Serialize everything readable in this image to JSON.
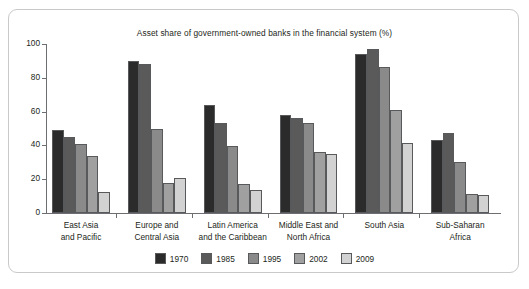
{
  "chart_data": {
    "type": "bar",
    "title": "Asset share of government-owned banks in the financial system (%)",
    "xlabel": "",
    "ylabel": "",
    "ylim": [
      0,
      100
    ],
    "yticks": [
      0,
      20,
      40,
      60,
      80,
      100
    ],
    "grid": false,
    "legend_position": "bottom-center",
    "categories": [
      "East Asia\nand Pacific",
      "Europe and\nCentral Asia",
      "Latin America\nand the Caribbean",
      "Middle East and\nNorth Africa",
      "South Asia",
      "Sub-Saharan\nAfrica"
    ],
    "series": [
      {
        "name": "1970",
        "color": "#2b2b2b",
        "values": [
          49,
          90,
          64,
          58,
          94,
          43.5
        ]
      },
      {
        "name": "1985",
        "color": "#5a5a5a",
        "values": [
          45,
          88,
          53,
          56,
          97,
          47.5
        ]
      },
      {
        "name": "1995",
        "color": "#8a8a8a",
        "values": [
          41,
          49.5,
          39.5,
          53.5,
          86.5,
          30
        ]
      },
      {
        "name": "2002",
        "color": "#a0a0a0",
        "values": [
          33.5,
          18,
          17,
          36,
          61,
          11
        ]
      },
      {
        "name": "2009",
        "color": "#d2d2d2",
        "values": [
          12.5,
          20.5,
          13.5,
          35,
          41.5,
          10.5
        ]
      }
    ]
  },
  "frame": {
    "border_color": "#c9c9c9"
  },
  "axis": {
    "color": "#6d6e71"
  }
}
